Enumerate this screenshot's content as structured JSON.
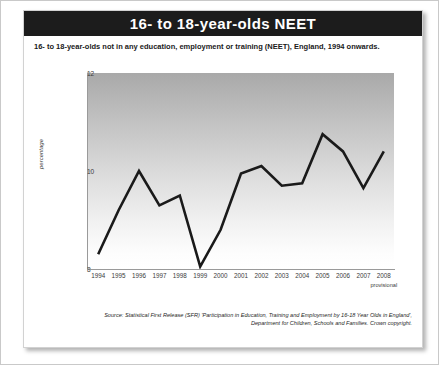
{
  "card": {
    "title": "16- to 18-year-olds NEET",
    "subtitle": "16- to 18-year-olds not in any education, employment or training (NEET), England, 1994 onwards.",
    "source_line1": "Source: Statistical First Release (SFR) 'Participation in Education, Training and Employment by 16-18 Year Olds in England',",
    "source_line2": "Department for Children, Schools and Families. Crown copyright."
  },
  "chart_data": {
    "type": "line",
    "title": "16- to 18-year-olds NEET",
    "subtitle": "16- to 18-year-olds not in any education, employment or training (NEET), England, 1994 onwards.",
    "xlabel": "",
    "ylabel": "percentage",
    "categories": [
      "1994",
      "1995",
      "1996",
      "1997",
      "1998",
      "1999",
      "2000",
      "2001",
      "2002",
      "2003",
      "2004",
      "2005",
      "2006",
      "2007",
      "2008"
    ],
    "values": [
      8.3,
      9.2,
      10.0,
      9.3,
      9.5,
      8.05,
      8.8,
      9.95,
      10.1,
      9.7,
      9.75,
      10.75,
      10.4,
      9.65,
      10.4
    ],
    "ylim": [
      8,
      12
    ],
    "yticks": [
      "8",
      "10",
      "12"
    ],
    "ytick_values": [
      8,
      10,
      12
    ],
    "grid": false,
    "legend": "none",
    "annotations": [
      {
        "category": "2008",
        "text": "provisional"
      }
    ],
    "series_color": "#1a1a1a",
    "plot_background": "vertical gradient grey to white"
  },
  "colors": {
    "header_bg": "#1c1c1c",
    "header_text": "#ffffff",
    "line": "#1a1a1a",
    "axis": "#9a9a9a",
    "card_border": "#d2d2d2",
    "outer_border": "#c9c9c9"
  }
}
